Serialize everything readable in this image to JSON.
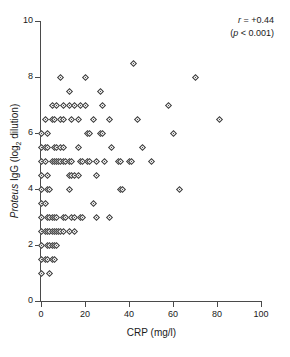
{
  "chart_data": {
    "type": "scatter",
    "title": "",
    "xlabel": "CRP (mg/l)",
    "ylabel": "Proteus IgG (log2 dilution)",
    "ylabel_parts": {
      "italic": "Proteus",
      "rest_before_sub": " IgG (log",
      "sub": "2",
      "rest_after_sub": " dilution)"
    },
    "xlim": [
      0,
      100
    ],
    "ylim": [
      0,
      10
    ],
    "xticks": [
      0,
      20,
      40,
      60,
      80,
      100
    ],
    "yticks": [
      0,
      2,
      4,
      6,
      8,
      10
    ],
    "grid": false,
    "legend": null,
    "marker": "diamond",
    "annotations": [
      {
        "text_italic": "r",
        "text": " = +0.44"
      },
      {
        "text_italic": "p",
        "text_prefix": "(",
        "text": " < 0.001)"
      }
    ],
    "annotation_lines": [
      "r = +0.44",
      "(p < 0.001)"
    ],
    "statistics": {
      "r": "+0.44",
      "p": "<0.001"
    },
    "points": [
      [
        0,
        6
      ],
      [
        0,
        5.5
      ],
      [
        0,
        5
      ],
      [
        0,
        4.5
      ],
      [
        0,
        4
      ],
      [
        0,
        3.5
      ],
      [
        0,
        3
      ],
      [
        0,
        2.5
      ],
      [
        0,
        2
      ],
      [
        0,
        1.5
      ],
      [
        0,
        1
      ],
      [
        2,
        6.5
      ],
      [
        3,
        6
      ],
      [
        2,
        5.5
      ],
      [
        3,
        5.5
      ],
      [
        2,
        5
      ],
      [
        3,
        4.5
      ],
      [
        3,
        4
      ],
      [
        4,
        4
      ],
      [
        2,
        3.5
      ],
      [
        3,
        3
      ],
      [
        4,
        3
      ],
      [
        2,
        2.5
      ],
      [
        3,
        2.5
      ],
      [
        4,
        2.5
      ],
      [
        3,
        2
      ],
      [
        4,
        2
      ],
      [
        2,
        1.5
      ],
      [
        3,
        1.5
      ],
      [
        4,
        1
      ],
      [
        5,
        6.5
      ],
      [
        6,
        6.5
      ],
      [
        5,
        7
      ],
      [
        7,
        7
      ],
      [
        6,
        5.5
      ],
      [
        7,
        5.5
      ],
      [
        5,
        5
      ],
      [
        6,
        5
      ],
      [
        7,
        5
      ],
      [
        8,
        5
      ],
      [
        5,
        2.5
      ],
      [
        6,
        2.5
      ],
      [
        7,
        2.5
      ],
      [
        8,
        2.5
      ],
      [
        9,
        2.5
      ],
      [
        5,
        3
      ],
      [
        6,
        3
      ],
      [
        7,
        3
      ],
      [
        5,
        2
      ],
      [
        6,
        2
      ],
      [
        7,
        2
      ],
      [
        5,
        1.5
      ],
      [
        6,
        1.5
      ],
      [
        9,
        8
      ],
      [
        10,
        7
      ],
      [
        9,
        6.5
      ],
      [
        10,
        6.5
      ],
      [
        9,
        5.5
      ],
      [
        10,
        5.5
      ],
      [
        9,
        5
      ],
      [
        10,
        5
      ],
      [
        11,
        5
      ],
      [
        10,
        3
      ],
      [
        11,
        3
      ],
      [
        10,
        2.5
      ],
      [
        13,
        7.5
      ],
      [
        13,
        7
      ],
      [
        14,
        6.5
      ],
      [
        15,
        7
      ],
      [
        13,
        5
      ],
      [
        14,
        5
      ],
      [
        13,
        4.5
      ],
      [
        14,
        4.5
      ],
      [
        15,
        4.5
      ],
      [
        13,
        4
      ],
      [
        14,
        3
      ],
      [
        15,
        3
      ],
      [
        13,
        2.5
      ],
      [
        15,
        2.5
      ],
      [
        17,
        6.5
      ],
      [
        18,
        7
      ],
      [
        17,
        5.5
      ],
      [
        18,
        5
      ],
      [
        19,
        5
      ],
      [
        17,
        4.5
      ],
      [
        18,
        3
      ],
      [
        19,
        3
      ],
      [
        20,
        8
      ],
      [
        21,
        6
      ],
      [
        22,
        6
      ],
      [
        20,
        7
      ],
      [
        21,
        5
      ],
      [
        22,
        5
      ],
      [
        24,
        6.5
      ],
      [
        25,
        5
      ],
      [
        24,
        3.5
      ],
      [
        25,
        4.5
      ],
      [
        25,
        3
      ],
      [
        27,
        7.5
      ],
      [
        28,
        7
      ],
      [
        27,
        6
      ],
      [
        28,
        6
      ],
      [
        29,
        5
      ],
      [
        31,
        6.5
      ],
      [
        31,
        3
      ],
      [
        32,
        5.5
      ],
      [
        35,
        5
      ],
      [
        36,
        5
      ],
      [
        36,
        4
      ],
      [
        37,
        4
      ],
      [
        40,
        5
      ],
      [
        41,
        5
      ],
      [
        42,
        8.5
      ],
      [
        44,
        6.5
      ],
      [
        46,
        5.5
      ],
      [
        50,
        5
      ],
      [
        58,
        7
      ],
      [
        60,
        6
      ],
      [
        63,
        4
      ],
      [
        70,
        8
      ],
      [
        81,
        6.5
      ]
    ]
  }
}
